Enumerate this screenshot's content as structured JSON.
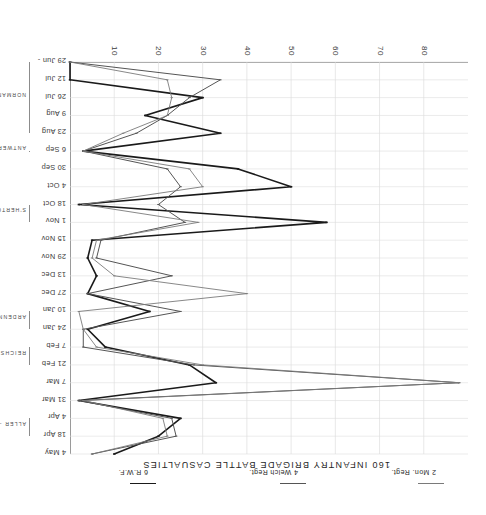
{
  "chart_data": {
    "type": "line",
    "title": "160 INFANTRY BRIGADE BATTLE CASUALTIES",
    "xlabel": "",
    "ylabel": "",
    "ylim": [
      0,
      90
    ],
    "yticks": [
      10,
      20,
      30,
      40,
      50,
      60,
      70,
      80
    ],
    "ytick_labels": [
      "10",
      "20",
      "30",
      "40",
      "50",
      "60",
      "70",
      "80"
    ],
    "grid": true,
    "legend_position": "right",
    "categories": [
      "29 Jun -",
      "12 Jul",
      "26 Jul",
      "9 Aug",
      "23 Aug",
      "6 Sep",
      "30 Sep",
      "4 Oct",
      "18 Oct",
      "1 Nov",
      "15 Nov",
      "29 Nov",
      "13 Dec",
      "27 Dec",
      "10 Jan",
      "24 Jan",
      "7 Feb",
      "21 Feb",
      "7 Mar",
      "31 Mar",
      "4 Apr",
      "18 Apr",
      "4 May"
    ],
    "series": [
      {
        "name": "6 R.W.F.",
        "color": "#1a1a1a",
        "width": 1.6,
        "values": [
          0,
          0,
          30,
          17,
          34,
          3,
          38,
          50,
          2,
          58,
          5,
          4,
          6,
          4,
          18,
          4,
          8,
          27,
          33,
          2,
          25,
          20,
          10
        ]
      },
      {
        "name": "4 Welch Regt.",
        "color": "#555555",
        "width": 1.0,
        "values": [
          0,
          34,
          27,
          22,
          15,
          3,
          22,
          25,
          20,
          26,
          7,
          6,
          23,
          4,
          25,
          3,
          3,
          28,
          88,
          2,
          23,
          24,
          5
        ]
      },
      {
        "name": "2 Mon. Regt.",
        "color": "#7a7a7a",
        "width": 0.9,
        "values": [
          0,
          22,
          23,
          22,
          12,
          3,
          27,
          30,
          3,
          29,
          6,
          5,
          10,
          40,
          2,
          3,
          6,
          30,
          88,
          3,
          21,
          22,
          5
        ]
      }
    ],
    "campaigns": [
      {
        "label": "NORMANDY",
        "start": "29 Jun -",
        "end": "23 Aug"
      },
      {
        "label": "ANTWERP",
        "start": "6 Sep",
        "end": "6 Sep"
      },
      {
        "label": "S'HERTOGENBOSCH",
        "start": "18 Oct",
        "end": "1 Nov"
      },
      {
        "label": "ARDENNES",
        "start": "10 Jan",
        "end": "24 Jan"
      },
      {
        "label": "REICHSWALD",
        "start": "7 Feb",
        "end": "21 Feb"
      },
      {
        "label": "ALLER - WESER",
        "start": "4 Apr",
        "end": "18 Apr"
      }
    ]
  },
  "legend": {
    "entries": [
      {
        "label": "6 R.W.F.",
        "color": "#1a1a1a"
      },
      {
        "label": "4 Welch Regt.",
        "color": "#555555"
      },
      {
        "label": "2 Mon. Regt.",
        "color": "#7a7a7a"
      }
    ]
  }
}
